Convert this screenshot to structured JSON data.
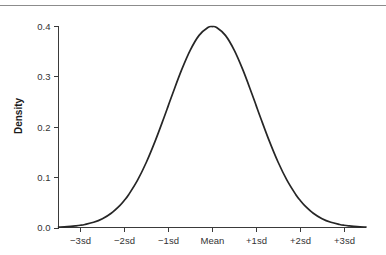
{
  "figure": {
    "width": 386,
    "height": 255,
    "background_color": "#ffffff",
    "top_rule_color": "#8c8c8c",
    "axis_color": "#3a3a3a",
    "curve_color": "#262626"
  },
  "chart_data": {
    "type": "line",
    "title": "",
    "subtitle": "",
    "xlabel": "",
    "ylabel": "Density",
    "xlim": [
      -3.5,
      3.5
    ],
    "ylim": [
      0.0,
      0.42
    ],
    "grid": false,
    "legend": null,
    "annotations": [],
    "x_tick_labels": [
      "−3sd",
      "−2sd",
      "−1sd",
      "Mean",
      "+1sd",
      "+2sd",
      "+3sd"
    ],
    "x_tick_values": [
      -3,
      -2,
      -1,
      0,
      1,
      2,
      3
    ],
    "y_tick_labels": [
      "0.0",
      "0.1",
      "0.2",
      "0.3",
      "0.4"
    ],
    "y_tick_values": [
      0.0,
      0.1,
      0.2,
      0.3,
      0.4
    ],
    "series": [
      {
        "name": "Standard normal density",
        "x": [
          -3.5,
          -3.3,
          -3.1,
          -3.0,
          -2.9,
          -2.7,
          -2.5,
          -2.3,
          -2.1,
          -2.0,
          -1.9,
          -1.7,
          -1.5,
          -1.3,
          -1.1,
          -1.0,
          -0.9,
          -0.7,
          -0.5,
          -0.3,
          -0.1,
          0.0,
          0.1,
          0.3,
          0.5,
          0.7,
          0.9,
          1.0,
          1.1,
          1.3,
          1.5,
          1.7,
          1.9,
          2.0,
          2.1,
          2.3,
          2.5,
          2.7,
          2.9,
          3.0,
          3.1,
          3.3,
          3.5
        ],
        "y": [
          0.0009,
          0.0017,
          0.0033,
          0.0044,
          0.006,
          0.0104,
          0.0175,
          0.0283,
          0.044,
          0.054,
          0.0656,
          0.094,
          0.1295,
          0.1714,
          0.2179,
          0.242,
          0.2661,
          0.3123,
          0.3521,
          0.3814,
          0.397,
          0.3989,
          0.397,
          0.3814,
          0.3521,
          0.3123,
          0.2661,
          0.242,
          0.2179,
          0.1714,
          0.1295,
          0.094,
          0.0656,
          0.054,
          0.044,
          0.0283,
          0.0175,
          0.0104,
          0.006,
          0.0044,
          0.0033,
          0.0017,
          0.0009
        ]
      }
    ],
    "peak": {
      "x_label": "Mean",
      "y_value": 0.3989
    }
  }
}
